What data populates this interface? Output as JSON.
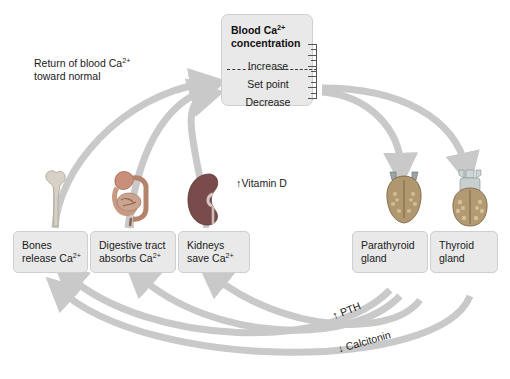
{
  "diagram": {
    "accent_arrow_color": "#c9c9c9",
    "box_fill_color": "#e9e9e9",
    "box_border_color": "#cfcfcf",
    "text_color": "#1a1a1a"
  },
  "center_box": {
    "title_line1": "Blood Ca",
    "title_sup": "2+",
    "title_line2": "concentration",
    "levels": {
      "increase": "Increase",
      "set_point": "Set point",
      "decrease": "Decrease"
    },
    "ruler_ticks": 11
  },
  "labels": {
    "return": {
      "line1_text": "Return of blood Ca",
      "line1_sup": "2+",
      "line2": "toward normal"
    },
    "vitamin_d": "Vitamin D",
    "pth": "PTH",
    "calcitonin": "Calcitonin",
    "up_arrow_glyph": "↑",
    "down_arrow_glyph": "↓"
  },
  "effector_boxes": [
    {
      "id": "bones",
      "line1": "Bones",
      "line2": "release Ca",
      "sup": "2+",
      "organ": "bone-icon"
    },
    {
      "id": "digestive",
      "line1": "Digestive tract",
      "line2": "absorbs Ca",
      "sup": "2+",
      "organ": "digestive-tract-icon"
    },
    {
      "id": "kidneys",
      "line1": "Kidneys",
      "line2": "save Ca",
      "sup": "2+",
      "organ": "kidney-icon"
    }
  ],
  "gland_boxes": [
    {
      "id": "parathyroid",
      "line1": "Parathyroid",
      "line2": "gland",
      "organ": "parathyroid-gland-icon"
    },
    {
      "id": "thyroid",
      "line1": "Thyroid",
      "line2": "gland",
      "organ": "thyroid-gland-icon"
    }
  ]
}
